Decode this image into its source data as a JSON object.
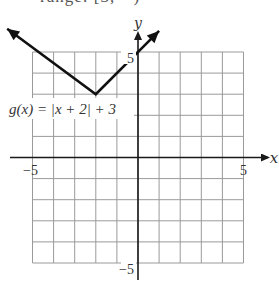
{
  "header": {
    "clipped_text": "range: [3, ∞)"
  },
  "chart_data": {
    "type": "line",
    "title": "",
    "function_label": "g(x) = |x + 2| + 3",
    "xlabel": "x",
    "ylabel": "y",
    "xlim": [
      -5,
      5
    ],
    "ylim": [
      -5,
      5
    ],
    "x_tick_labels": [
      {
        "value": -5,
        "label": "−5"
      },
      {
        "value": 5,
        "label": "5"
      }
    ],
    "y_tick_labels": [
      {
        "value": 5,
        "label": "5"
      },
      {
        "value": -5,
        "label": "−5"
      }
    ],
    "grid": true,
    "grid_step": 1,
    "series": [
      {
        "name": "g(x) = |x + 2| + 3",
        "x": [
          -6.2,
          -2,
          1.0
        ],
        "y": [
          6.1,
          3,
          6.0
        ],
        "vertex": [
          -2,
          3
        ],
        "arrows_both_ends": true
      }
    ],
    "colors": {
      "grid": "#9a9a9a",
      "axes": "#1a1a1a",
      "curve": "#111111",
      "text": "#333333"
    }
  }
}
